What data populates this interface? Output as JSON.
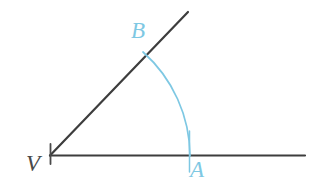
{
  "figure": {
    "kind": "geometry-diagram",
    "background_color": "#ffffff",
    "width": 316,
    "height": 185,
    "colors": {
      "line": "#3d3d3d",
      "arc": "#7ec8e3",
      "vertex_label": "#4a4a4a",
      "point_label": "#7ec8e3"
    },
    "labels": {
      "vertex": "V",
      "point_on_ray": "B",
      "point_on_base": "A"
    },
    "geometry": {
      "vertex": [
        50,
        155
      ],
      "ray_end": [
        188,
        12
      ],
      "base_line_start": [
        50,
        155
      ],
      "base_line_end": [
        305,
        155
      ],
      "arc_radius": 140,
      "arc_point_A": [
        190,
        156
      ],
      "arc_point_B": [
        143,
        52
      ],
      "tick_mark_at_vertex": true,
      "line_width": 2,
      "arc_width": 1.6
    }
  }
}
